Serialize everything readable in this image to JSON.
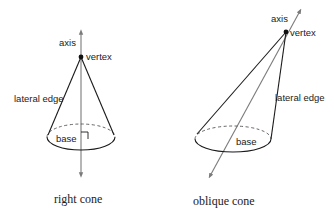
{
  "figures": [
    {
      "id": "right-cone",
      "caption": "right cone",
      "labels": {
        "axis": "axis",
        "vertex": "vertex",
        "lateral_edge": "lateral edge",
        "base": "base"
      },
      "features": [
        "right-angle-mark",
        "dashed-hidden-base-edge",
        "double-arrow-axis"
      ]
    },
    {
      "id": "oblique-cone",
      "caption": "oblique cone",
      "labels": {
        "axis": "axis",
        "vertex": "vertex",
        "lateral_edge": "lateral edge",
        "base": "base"
      },
      "features": [
        "dashed-hidden-base-edge",
        "double-arrow-axis"
      ]
    }
  ],
  "colors": {
    "edge": "#1a1a1a",
    "axis": "#7a7a7a",
    "background": "#ffffff"
  }
}
